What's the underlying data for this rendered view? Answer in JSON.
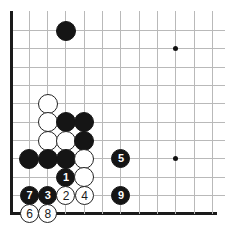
{
  "diagram": {
    "kind": "go-board-diagram",
    "board_size": 19,
    "visible_corner": "lower-left",
    "geometry": {
      "origin_x": 11,
      "origin_y": 30.6,
      "spacing": 18.33,
      "cols_visible": 12,
      "rows_visible": 11,
      "stone_diameter": 20,
      "numbered_stone_diameter": 19
    },
    "colors": {
      "background": "#ffffff",
      "grid": "#b9b9b9",
      "edge": "#1a1a1a",
      "black_stone": "#151515",
      "white_stone": "#ffffff",
      "white_stone_outline": "#232323",
      "black_label": "#ffffff",
      "white_label": "#1a1a1a"
    },
    "edges": {
      "left": true,
      "bottom": true,
      "top": false,
      "right": false
    },
    "star_points": [
      {
        "col": 9,
        "row": 1
      },
      {
        "col": 9,
        "row": 7
      }
    ],
    "stones": [
      {
        "color": "black",
        "col": 3,
        "row": 0,
        "label": ""
      },
      {
        "color": "white",
        "col": 2,
        "row": 4,
        "label": ""
      },
      {
        "color": "white",
        "col": 2,
        "row": 5,
        "label": ""
      },
      {
        "color": "black",
        "col": 3,
        "row": 5,
        "label": ""
      },
      {
        "color": "black",
        "col": 4,
        "row": 5,
        "label": ""
      },
      {
        "color": "white",
        "col": 2,
        "row": 6,
        "label": ""
      },
      {
        "color": "white",
        "col": 3,
        "row": 6,
        "label": ""
      },
      {
        "color": "black",
        "col": 4,
        "row": 6,
        "label": ""
      },
      {
        "color": "black",
        "col": 1,
        "row": 7,
        "label": ""
      },
      {
        "color": "black",
        "col": 2,
        "row": 7,
        "label": ""
      },
      {
        "color": "black",
        "col": 3,
        "row": 7,
        "label": ""
      },
      {
        "color": "white",
        "col": 4,
        "row": 7,
        "label": ""
      },
      {
        "color": "black",
        "col": 6,
        "row": 7,
        "label": "5"
      },
      {
        "color": "black",
        "col": 3,
        "row": 8,
        "label": "1"
      },
      {
        "color": "white",
        "col": 4,
        "row": 8,
        "label": ""
      },
      {
        "color": "black",
        "col": 1,
        "row": 9,
        "label": "7"
      },
      {
        "color": "black",
        "col": 2,
        "row": 9,
        "label": "3"
      },
      {
        "color": "white",
        "col": 3,
        "row": 9,
        "label": "2"
      },
      {
        "color": "white",
        "col": 4,
        "row": 9,
        "label": "4"
      },
      {
        "color": "black",
        "col": 6,
        "row": 9,
        "label": "9"
      },
      {
        "color": "white",
        "col": 1,
        "row": 10,
        "label": "6",
        "off_board": true
      },
      {
        "color": "white",
        "col": 2,
        "row": 10,
        "label": "8",
        "off_board": true
      }
    ]
  }
}
